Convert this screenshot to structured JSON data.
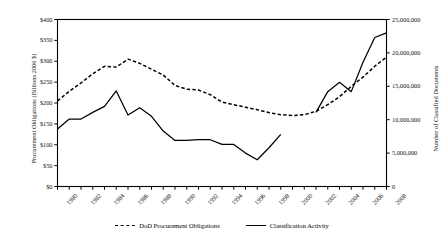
{
  "chart_data": {
    "type": "line",
    "title": "",
    "xlabel": "",
    "ylabel": "Procurement Obligations (Billions 2006 $)",
    "y2label": "Number of Classified Documents",
    "x": [
      1980,
      1981,
      1982,
      1983,
      1984,
      1985,
      1986,
      1987,
      1988,
      1989,
      1990,
      1991,
      1992,
      1993,
      1994,
      1995,
      1996,
      1997,
      1998,
      1999,
      2000,
      2001,
      2002,
      2003,
      2004,
      2005,
      2006,
      2007,
      2008
    ],
    "xlim": [
      1980,
      2008
    ],
    "ylim": [
      0,
      400
    ],
    "y2lim": [
      0,
      25000000
    ],
    "yticks": [
      0,
      50,
      100,
      150,
      200,
      250,
      300,
      350,
      400
    ],
    "ytick_labels": [
      "$0",
      "$50",
      "$100",
      "$150",
      "$200",
      "$250",
      "$300",
      "$350",
      "$400"
    ],
    "y2ticks": [
      0,
      5000000,
      10000000,
      15000000,
      20000000,
      25000000
    ],
    "y2tick_labels": [
      "0",
      "5,000,000",
      "10,000,000",
      "15,000,000",
      "20,000,000",
      "25,000,000"
    ],
    "xtick_labels": [
      "1980",
      "1982",
      "1984",
      "1986",
      "1988",
      "1990",
      "1992",
      "1994",
      "1996",
      "1998",
      "2000",
      "2002",
      "2004",
      "2006",
      "2008"
    ],
    "grid": false,
    "legend_position": "bottom",
    "series": [
      {
        "name": "DoD Procurement Obligations",
        "axis": "left",
        "style": "dashed",
        "color": "#000000",
        "units": "Billions 2006 $",
        "x": [
          1980,
          1981,
          1982,
          1983,
          1984,
          1985,
          1986,
          1987,
          1988,
          1989,
          1990,
          1991,
          1992,
          1993,
          1994,
          1995,
          1996,
          1997,
          1998,
          1999,
          2000,
          2001,
          2002,
          2003,
          2004,
          2005,
          2006,
          2007,
          2008
        ],
        "values": [
          205,
          228,
          248,
          270,
          288,
          286,
          305,
          295,
          281,
          267,
          242,
          233,
          231,
          220,
          202,
          196,
          190,
          184,
          177,
          172,
          170,
          172,
          180,
          196,
          215,
          240,
          262,
          288,
          310
        ]
      },
      {
        "name": "Classification Activity",
        "axis": "right",
        "style": "solid",
        "color": "#000000",
        "units": "Number of Classified Documents",
        "has_gap": true,
        "gap_between": [
          1999,
          2002
        ],
        "x": [
          1980,
          1981,
          1982,
          1983,
          1984,
          1985,
          1986,
          1987,
          1988,
          1989,
          1990,
          1991,
          1992,
          1993,
          1994,
          1995,
          1996,
          1997,
          1998,
          1999,
          2002,
          2003,
          2004,
          2005,
          2006,
          2007,
          2008
        ],
        "values": [
          8600000,
          10100000,
          10100000,
          11100000,
          12000000,
          14300000,
          10700000,
          11800000,
          10500000,
          8300000,
          6900000,
          6900000,
          7000000,
          7000000,
          6300000,
          6300000,
          5000000,
          4000000,
          5800000,
          7800000,
          11100000,
          14200000,
          15600000,
          14200000,
          18600000,
          22300000,
          23000000
        ]
      }
    ],
    "legend": [
      {
        "label": "DoD Procurement Obligations",
        "style": "dashed"
      },
      {
        "label": "Classification Activity",
        "style": "solid"
      }
    ]
  }
}
